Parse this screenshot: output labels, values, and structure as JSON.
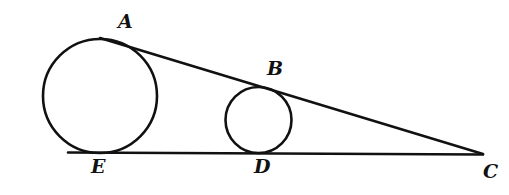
{
  "figure": {
    "background_color": "#ffffff",
    "stroke_color": "#111111",
    "fill_color": "none",
    "width": 509,
    "height": 195
  },
  "labels": {
    "a": "A",
    "b": "B",
    "c": "C",
    "d": "D",
    "e": "E"
  },
  "chart_data": {
    "type": "diagram",
    "xlabel": "",
    "ylabel": "",
    "xlim": [
      0,
      509
    ],
    "ylim": [
      0,
      195
    ],
    "grid": false,
    "legend": "none",
    "points": [
      {
        "name": "A",
        "x": 103,
        "y": 39,
        "label": "A",
        "label_x": 118,
        "label_y": 12,
        "role": "tangency-point-upper-large-circle"
      },
      {
        "name": "B",
        "x": 262,
        "y": 87,
        "label": "B",
        "label_x": 267,
        "label_y": 59,
        "role": "tangency-point-upper-small-circle"
      },
      {
        "name": "C",
        "x": 483,
        "y": 154,
        "label": "C",
        "label_x": 483,
        "label_y": 162,
        "role": "apex-of-angle"
      },
      {
        "name": "D",
        "x": 258,
        "y": 153,
        "label": "D",
        "label_x": 254,
        "label_y": 157,
        "role": "tangency-point-lower-small-circle"
      },
      {
        "name": "E",
        "x": 100,
        "y": 153,
        "label": "E",
        "label_x": 91,
        "label_y": 157,
        "role": "tangency-point-lower-large-circle"
      }
    ],
    "circles": [
      {
        "name": "large-circle",
        "cx": 100,
        "cy": 96,
        "r": 57,
        "stroke": "#111111",
        "stroke_width": 2.6,
        "fill": "none"
      },
      {
        "name": "small-circle",
        "cx": 258.5,
        "cy": 120,
        "r": 33,
        "stroke": "#111111",
        "stroke_width": 2.6,
        "fill": "none"
      }
    ],
    "lines": [
      {
        "name": "upper-tangent-line",
        "x1": 100,
        "y1": 38,
        "x2": 483,
        "y2": 154,
        "stroke": "#111111",
        "stroke_width": 2.6,
        "through": [
          "A",
          "B",
          "C"
        ]
      },
      {
        "name": "lower-tangent-line",
        "x1": 68,
        "y1": 152.5,
        "x2": 483,
        "y2": 154.5,
        "stroke": "#111111",
        "stroke_width": 2.6,
        "through": [
          "E",
          "D",
          "C"
        ]
      }
    ]
  }
}
